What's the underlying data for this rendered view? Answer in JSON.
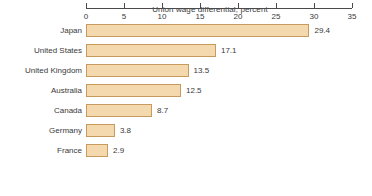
{
  "chart_data": {
    "type": "bar",
    "orientation": "horizontal",
    "title": "Union wage differential, percent",
    "xlabel": "",
    "ylabel": "",
    "categories": [
      "Japan",
      "United States",
      "United Kingdom",
      "Australia",
      "Canada",
      "Germany",
      "France"
    ],
    "values": [
      29.4,
      17.1,
      13.5,
      12.5,
      8.7,
      3.8,
      2.9
    ],
    "value_labels": [
      "29.4",
      "17.1",
      "13.5",
      "12.5",
      "8.7",
      "3.8",
      "2.9"
    ],
    "xlim": [
      0,
      35
    ],
    "xticks": [
      0,
      5,
      10,
      15,
      20,
      25,
      30,
      35
    ],
    "xtick_labels": [
      "0",
      "5",
      "10",
      "15",
      "20",
      "25",
      "30",
      "35"
    ],
    "grid": false,
    "legend": null,
    "bar_fill_color": "#f3d9ad",
    "bar_border_color": "#c79a5d",
    "axis_color": "#4a4a4a",
    "text_color": "#3a3a3a",
    "background_color": "#ffffff"
  }
}
